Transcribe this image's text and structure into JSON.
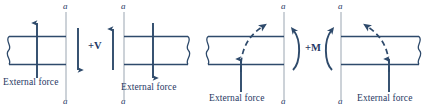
{
  "figure": {
    "type": "engineering-diagram",
    "width": 432,
    "height": 110,
    "background_color": "#ffffff",
    "line_color": "#2e4a6b",
    "accent_color": "#1f3864",
    "section_line_color": "#9aa5b1"
  },
  "labels": {
    "section_top": "a",
    "section_bottom": "a",
    "external_force": "External force",
    "positive_shear": "+V",
    "positive_moment": "+M"
  },
  "panels": [
    {
      "id": "shear-left",
      "caption": "External force",
      "section_label_top": "a",
      "section_label_bottom": "a",
      "beam_side": "left",
      "break_edge": "left",
      "internal_arrow_direction": "down",
      "external_arrow_direction": "up"
    },
    {
      "id": "shear-right",
      "caption": "External force",
      "section_label_top": "a",
      "section_label_bottom": "a",
      "beam_side": "right",
      "break_edge": "right",
      "internal_arrow_direction": "up",
      "external_arrow_direction": "down"
    },
    {
      "id": "moment-left",
      "caption": "External force",
      "section_label_top": "a",
      "section_label_bottom": "a",
      "beam_side": "left",
      "break_edge": "left",
      "internal_moment_direction": "counterclockwise",
      "external_arrow_direction": "up",
      "deflection_curve": "dashed"
    },
    {
      "id": "moment-right",
      "caption": "External force",
      "section_label_top": "a",
      "section_label_bottom": "a",
      "beam_side": "right",
      "break_edge": "right",
      "internal_moment_direction": "clockwise",
      "external_arrow_direction": "up",
      "deflection_curve": "dashed"
    }
  ],
  "annotations": {
    "shear_symbol": "+V",
    "moment_symbol": "+M"
  }
}
